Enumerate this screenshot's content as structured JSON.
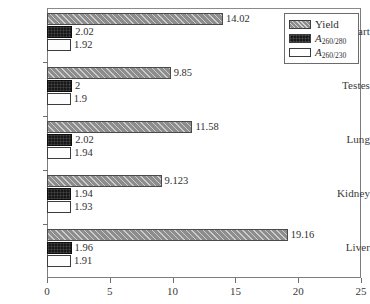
{
  "chart_data": {
    "type": "bar",
    "orientation": "horizontal",
    "title": "",
    "xlabel": "",
    "ylabel": "",
    "xlim": [
      0,
      25
    ],
    "xticks": [
      0,
      5,
      10,
      15,
      20,
      25
    ],
    "xtick_labels": [
      "0",
      "5",
      "10",
      "15",
      "20",
      "25"
    ],
    "grid": false,
    "legend_position": "top-right",
    "categories": [
      "Heart",
      "Testes",
      "Lung",
      "Kidney",
      "Liver"
    ],
    "series": [
      {
        "name": "Yield",
        "legend_label": "Yield",
        "color": "#8d8d8d",
        "pattern": "diagonal-hatch",
        "values": [
          14.02,
          9.85,
          11.58,
          9.123,
          19.16
        ],
        "labels": [
          "14.02",
          "9.85",
          "11.58",
          "9.123",
          "19.16"
        ]
      },
      {
        "name": "A260/280",
        "legend_label_base": "A",
        "legend_label_sub": "260/280",
        "color": "#181818",
        "pattern": "dark-fill",
        "values": [
          2.02,
          2,
          2.02,
          1.94,
          1.96
        ],
        "labels": [
          "2.02",
          "2",
          "2.02",
          "1.94",
          "1.96"
        ]
      },
      {
        "name": "A260/230",
        "legend_label_base": "A",
        "legend_label_sub": "260/230",
        "color": "#ffffff",
        "pattern": "empty-fill",
        "values": [
          1.92,
          1.9,
          1.94,
          1.93,
          1.91
        ],
        "labels": [
          "1.92",
          "1.9",
          "1.94",
          "1.93",
          "1.91"
        ]
      }
    ]
  }
}
